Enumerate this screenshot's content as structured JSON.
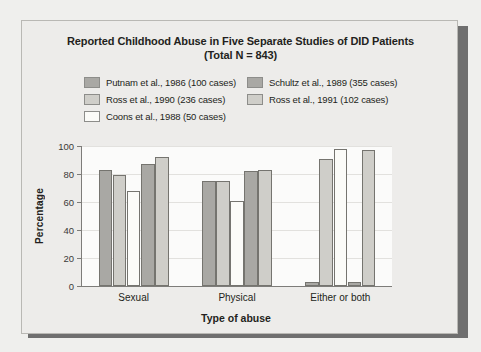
{
  "figure": {
    "title_line1": "Reported Childhood Abuse in Five Separate Studies of DID Patients",
    "title_line2": "(Total N = 843)"
  },
  "colors": {
    "series_putnam": "#a9a8a4",
    "series_ross1990": "#cfcec9",
    "series_coons": "#fbfbf8",
    "series_schultz": "#a9a8a4",
    "series_ross1991": "#cfcec9",
    "bar_border": "#75746f",
    "axis": "#7d7c79",
    "plot_bg": "#fbfbfa",
    "page_bg": "#edecea",
    "shadow": "#6f6f6f",
    "text": "#231f20"
  },
  "legend": {
    "rows": [
      [
        {
          "label": "Putnam et al., 1986 (100 cases)",
          "swatch": "#a9a8a4"
        },
        {
          "label": "Schultz et al., 1989 (355 cases)",
          "swatch": "#a9a8a4"
        }
      ],
      [
        {
          "label": "Ross et al., 1990 (236 cases)",
          "swatch": "#cfcec9"
        },
        {
          "label": "Ross et al., 1991 (102 cases)",
          "swatch": "#cfcec9"
        }
      ],
      [
        {
          "label": "Coons et al., 1988 (50 cases)",
          "swatch": "#fbfbf8"
        }
      ]
    ]
  },
  "chart_data": {
    "type": "bar",
    "title": "Reported Childhood Abuse in Five Separate Studies of DID Patients (Total N = 843)",
    "xlabel": "Type of abuse",
    "ylabel": "Percentage",
    "categories": [
      "Sexual",
      "Physical",
      "Either or both"
    ],
    "ylim": [
      0,
      100
    ],
    "yticks": [
      0,
      20,
      40,
      60,
      80,
      100
    ],
    "grid": true,
    "legend_position": "top",
    "series": [
      {
        "name": "Putnam et al., 1986 (100 cases)",
        "color": "#a9a8a4",
        "values": [
          83,
          75,
          3
        ]
      },
      {
        "name": "Ross et al., 1990 (236 cases)",
        "color": "#cfcec9",
        "values": [
          79,
          75,
          91
        ]
      },
      {
        "name": "Coons et al., 1988 (50 cases)",
        "color": "#fbfbf8",
        "values": [
          68,
          61,
          98
        ]
      },
      {
        "name": "Schultz et al., 1989 (355 cases)",
        "color": "#a9a8a4",
        "values": [
          87,
          82,
          3
        ]
      },
      {
        "name": "Ross et al., 1991 (102 cases)",
        "color": "#cfcec9",
        "values": [
          92,
          83,
          97
        ]
      }
    ]
  }
}
